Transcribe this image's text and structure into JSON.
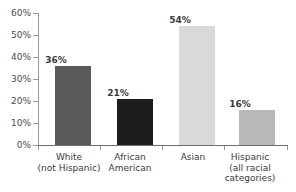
{
  "chart_data": {
    "type": "bar",
    "title": "",
    "xlabel": "",
    "ylabel": "",
    "ylim": [
      0,
      60
    ],
    "grid": false,
    "legend": null,
    "categories": [
      "White (not Hispanic)",
      "African American",
      "Asian",
      "Hispanic (all racial categories)"
    ],
    "category_lines": [
      [
        "White",
        "(not Hispanic)"
      ],
      [
        "African",
        "American"
      ],
      [
        "Asian"
      ],
      [
        "Hispanic",
        "(all racial",
        "categories)"
      ]
    ],
    "values": [
      36,
      21,
      54,
      16
    ],
    "value_labels": [
      "36%",
      "21%",
      "54%",
      "16%"
    ],
    "bar_colors": [
      "#5a5a5a",
      "#1c1c1c",
      "#d9d9d9",
      "#b8b8b8"
    ],
    "ytick_values": [
      0,
      10,
      20,
      30,
      40,
      50,
      60
    ],
    "ytick_labels": [
      "0%",
      "10%",
      "20%",
      "30%",
      "40%",
      "50%",
      "60%"
    ],
    "axis_color": "#9a9a9a"
  }
}
